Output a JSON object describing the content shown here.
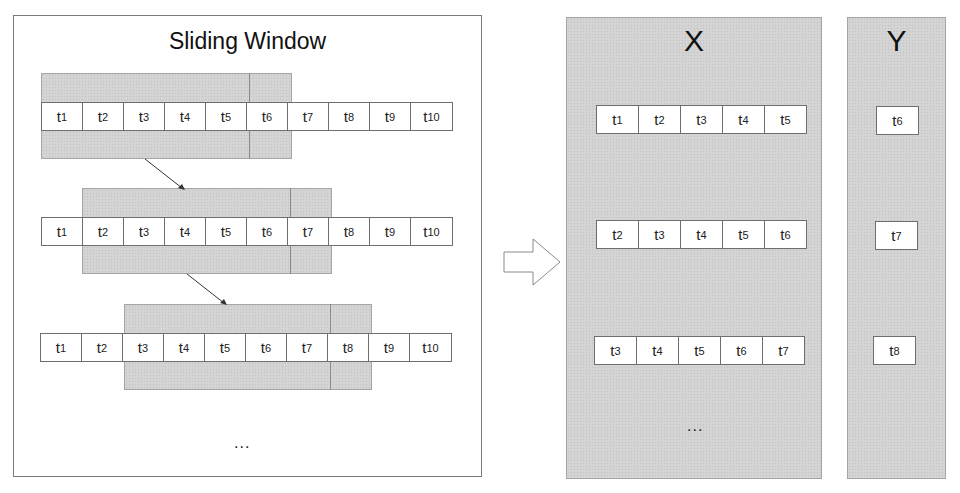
{
  "left_panel": {
    "title": "Sliding Window",
    "rows": [
      {
        "cells": [
          {
            "base": "t",
            "sub": "1"
          },
          {
            "base": "t",
            "sub": "2"
          },
          {
            "base": "t",
            "sub": "3"
          },
          {
            "base": "t",
            "sub": "4"
          },
          {
            "base": "t",
            "sub": "5"
          },
          {
            "base": "t",
            "sub": "6"
          },
          {
            "base": "t",
            "sub": "7"
          },
          {
            "base": "t",
            "sub": "8"
          },
          {
            "base": "t",
            "sub": "9"
          },
          {
            "base": "t",
            "sub": "10"
          }
        ],
        "window_start_index": 0,
        "window_input_length": 5,
        "window_target_length": 1
      },
      {
        "cells": [
          {
            "base": "t",
            "sub": "1"
          },
          {
            "base": "t",
            "sub": "2"
          },
          {
            "base": "t",
            "sub": "3"
          },
          {
            "base": "t",
            "sub": "4"
          },
          {
            "base": "t",
            "sub": "5"
          },
          {
            "base": "t",
            "sub": "6"
          },
          {
            "base": "t",
            "sub": "7"
          },
          {
            "base": "t",
            "sub": "8"
          },
          {
            "base": "t",
            "sub": "9"
          },
          {
            "base": "t",
            "sub": "10"
          }
        ],
        "window_start_index": 1,
        "window_input_length": 5,
        "window_target_length": 1
      },
      {
        "cells": [
          {
            "base": "t",
            "sub": "1"
          },
          {
            "base": "t",
            "sub": "2"
          },
          {
            "base": "t",
            "sub": "3"
          },
          {
            "base": "t",
            "sub": "4"
          },
          {
            "base": "t",
            "sub": "5"
          },
          {
            "base": "t",
            "sub": "6"
          },
          {
            "base": "t",
            "sub": "7"
          },
          {
            "base": "t",
            "sub": "8"
          },
          {
            "base": "t",
            "sub": "9"
          },
          {
            "base": "t",
            "sub": "10"
          }
        ],
        "window_start_index": 2,
        "window_input_length": 5,
        "window_target_length": 1
      }
    ],
    "continuation": "..."
  },
  "transform_arrow": "right-arrow",
  "x_panel": {
    "label": "X",
    "rows": [
      [
        {
          "base": "t",
          "sub": "1"
        },
        {
          "base": "t",
          "sub": "2"
        },
        {
          "base": "t",
          "sub": "3"
        },
        {
          "base": "t",
          "sub": "4"
        },
        {
          "base": "t",
          "sub": "5"
        }
      ],
      [
        {
          "base": "t",
          "sub": "2"
        },
        {
          "base": "t",
          "sub": "3"
        },
        {
          "base": "t",
          "sub": "4"
        },
        {
          "base": "t",
          "sub": "5"
        },
        {
          "base": "t",
          "sub": "6"
        }
      ],
      [
        {
          "base": "t",
          "sub": "3"
        },
        {
          "base": "t",
          "sub": "4"
        },
        {
          "base": "t",
          "sub": "5"
        },
        {
          "base": "t",
          "sub": "6"
        },
        {
          "base": "t",
          "sub": "7"
        }
      ]
    ],
    "continuation": "..."
  },
  "y_panel": {
    "label": "Y",
    "rows": [
      [
        {
          "base": "t",
          "sub": "6"
        }
      ],
      [
        {
          "base": "t",
          "sub": "7"
        }
      ],
      [
        {
          "base": "t",
          "sub": "8"
        }
      ]
    ]
  },
  "colors": {
    "band_fill": "#d2d2d2",
    "border": "#6e6e6e",
    "text": "#222222"
  }
}
